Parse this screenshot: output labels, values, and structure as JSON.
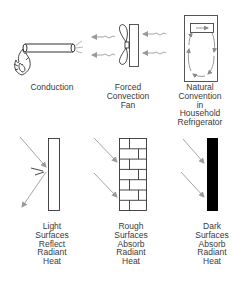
{
  "panels": {
    "conduction": {
      "lines": [
        "Conduction"
      ]
    },
    "forced_convection": {
      "lines": [
        "Forced",
        "Convection",
        "Fan"
      ]
    },
    "natural_convection": {
      "lines": [
        "Natural",
        "Convention",
        "in",
        "Household",
        "Refrigerator"
      ]
    },
    "light_surfaces": {
      "lines": [
        "Light",
        "Surfaces",
        "Reflect",
        "Radiant",
        "Heat"
      ]
    },
    "rough_surfaces": {
      "lines": [
        "Rough",
        "Surfaces",
        "Absorb",
        "Radiant",
        "Heat"
      ]
    },
    "dark_surfaces": {
      "lines": [
        "Dark",
        "Surfaces",
        "Absorb",
        "Radiant",
        "Heat"
      ]
    }
  },
  "icons": {
    "conduction": [
      "flame-icon",
      "heated-rod-icon",
      "heat-glow-icon"
    ],
    "forced_convection": [
      "fan-icon",
      "fan-grille-icon",
      "wavy-air-arrow-icon"
    ],
    "natural_convection": [
      "refrigerator-icon",
      "freezer-compartment-icon",
      "circulation-arrows-icon"
    ],
    "light_surfaces": [
      "light-wall-icon",
      "incident-ray-icon",
      "reflected-ray-icon"
    ],
    "rough_surfaces": [
      "brick-wall-icon",
      "incident-ray-icon"
    ],
    "dark_surfaces": [
      "dark-wall-icon",
      "incident-ray-icon"
    ]
  },
  "colors": {
    "line": "#333333",
    "arrow": "#9a9a9a",
    "dark_fill": "#000000"
  }
}
